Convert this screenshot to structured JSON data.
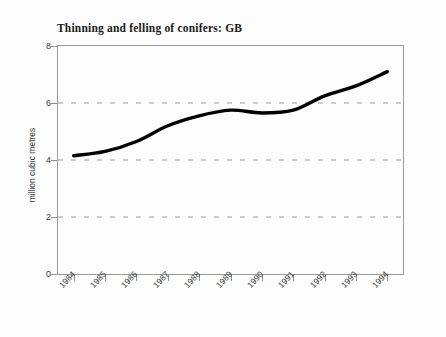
{
  "chart_data": {
    "type": "line",
    "title": "Thinning and felling of conifers: GB",
    "xlabel": "",
    "ylabel": "million cubic metres",
    "categories": [
      "1984",
      "1985",
      "1986",
      "1987",
      "1988",
      "1989",
      "1990",
      "1991",
      "1992",
      "1993",
      "1994"
    ],
    "values": [
      4.15,
      4.3,
      4.65,
      5.2,
      5.55,
      5.75,
      5.65,
      5.75,
      6.25,
      6.6,
      7.1
    ],
    "series": [
      {
        "name": "Thinning and felling of conifers: GB",
        "values": [
          4.15,
          4.3,
          4.65,
          5.2,
          5.55,
          5.75,
          5.65,
          5.75,
          6.25,
          6.6,
          7.1
        ],
        "color": "#000000"
      }
    ],
    "ylim": [
      0,
      8
    ],
    "y_ticks": [
      0,
      2,
      4,
      6,
      8
    ],
    "y_tick_labels": [
      "0",
      "2",
      "4",
      "6",
      "8"
    ],
    "gridlines_y": [
      2,
      4,
      6
    ],
    "grid": true,
    "grid_color": "#9a9a9a",
    "legend": "none",
    "line_color": "#000000",
    "line_width": 3.4,
    "smoothing": "spline",
    "frame_color": "#9a9a9a",
    "background": "#fdfdfd"
  }
}
